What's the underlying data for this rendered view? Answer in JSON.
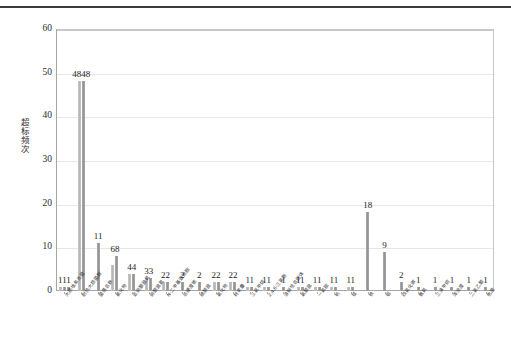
{
  "figure": {
    "has_top_rule": true,
    "background_color": "#ffffff",
    "bar_color": "#9a9a9a",
    "grid_color": "#e6e6e6",
    "axis_color": "#a6a6a6"
  },
  "chart_data": {
    "type": "bar",
    "title": "",
    "subtitle": "",
    "xlabel": "",
    "ylabel": "超标频次",
    "ylim": [
      0,
      60
    ],
    "yticks": [
      0,
      10,
      20,
      30,
      40,
      50,
      60
    ],
    "grid": true,
    "legend": "none",
    "categories": [
      "大肠杆菌群",
      "耐热大肠菌群",
      "菌落总数",
      "氟化物",
      "亚硝酸盐氮",
      "硝酸盐氮",
      "N-二甲基亚硝胺",
      "氯酸盐",
      "硫酸盐",
      "氯化物",
      "三氯甲烷",
      "耗氧量",
      "2,4,6-三氯酚",
      "溶解性总固体",
      "铝",
      "锰",
      "铁",
      "铅",
      "钠",
      "氨氮",
      "四氯化碳",
      "三溴甲烷",
      "色度",
      "浑浊度",
      "总硬度",
      "pH"
    ],
    "category_labels_display": [
      "大肠埃希氏菌",
      "耐热大肠菌群",
      "菌落总数",
      "氟化物",
      "亚硝酸盐氮",
      "硝酸盐氮",
      "N-二甲基亚硝胺",
      "总硬度铬",
      "硫酸盐",
      "氯化物",
      "耗氧量",
      "三氯甲烷",
      "2,4,6-三氯酚",
      "溶解性总固体",
      "氯酸盐",
      "一氯胺",
      "钠",
      "锰",
      "铁",
      "铝",
      "四氯化碳",
      "氨氮",
      "三溴甲烷",
      "浑浊度",
      "二氯乙酸",
      "色度"
    ],
    "groups": [
      {
        "label": "111",
        "values": [
          1,
          1,
          1
        ]
      },
      {
        "label": "4848",
        "values": [
          48,
          48
        ]
      },
      {
        "label": "11",
        "values": [
          11
        ]
      },
      {
        "label": "68",
        "values": [
          6,
          8
        ]
      },
      {
        "label": "44",
        "values": [
          4,
          4
        ]
      },
      {
        "label": "33",
        "values": [
          3,
          3
        ]
      },
      {
        "label": "22",
        "values": [
          2,
          2
        ]
      },
      {
        "label": "2",
        "values": [
          2
        ]
      },
      {
        "label": "2",
        "values": [
          2
        ]
      },
      {
        "label": "22",
        "values": [
          2,
          2
        ]
      },
      {
        "label": "22",
        "values": [
          2,
          2
        ]
      },
      {
        "label": "11",
        "values": [
          1,
          1
        ]
      },
      {
        "label": "11",
        "values": [
          1,
          1
        ]
      },
      {
        "label": "1",
        "values": [
          1
        ]
      },
      {
        "label": "11",
        "values": [
          1,
          1
        ]
      },
      {
        "label": "11",
        "values": [
          1,
          1
        ]
      },
      {
        "label": "11",
        "values": [
          1,
          1
        ]
      },
      {
        "label": "11",
        "values": [
          1,
          1
        ]
      },
      {
        "label": "18",
        "values": [
          18
        ]
      },
      {
        "label": "9",
        "values": [
          9
        ]
      },
      {
        "label": "2",
        "values": [
          2
        ]
      },
      {
        "label": "1",
        "values": [
          1
        ]
      },
      {
        "label": "1",
        "values": [
          1
        ]
      },
      {
        "label": "1",
        "values": [
          1
        ]
      },
      {
        "label": "1",
        "values": [
          1
        ]
      },
      {
        "label": "1",
        "values": [
          1
        ]
      }
    ]
  }
}
